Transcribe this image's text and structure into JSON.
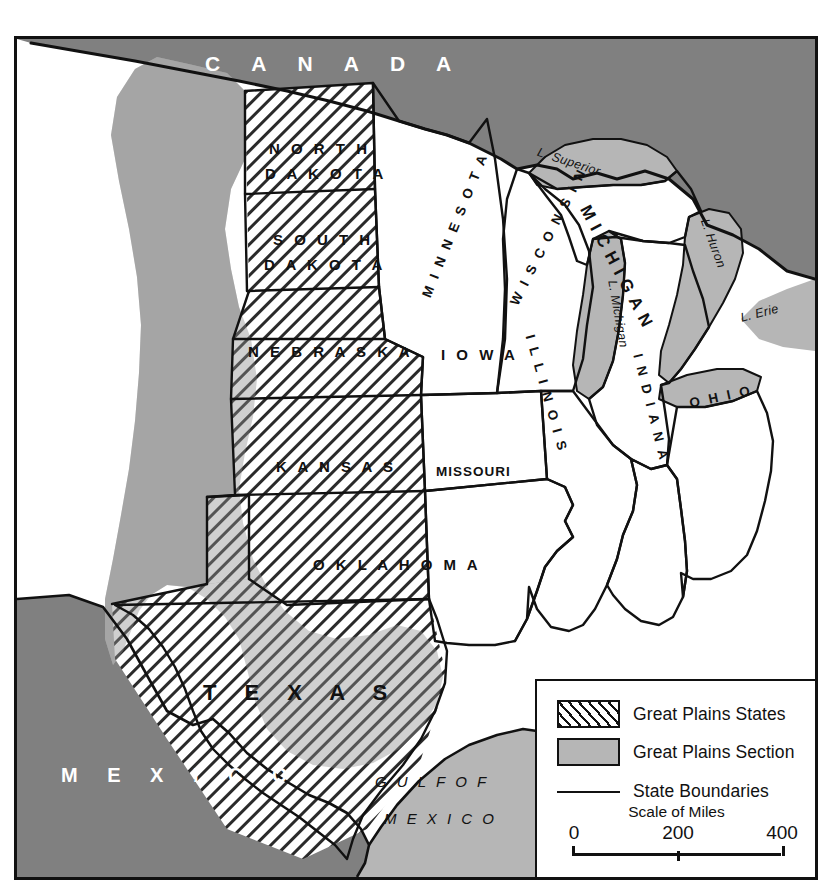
{
  "map": {
    "frame": {
      "border_color": "#111111"
    },
    "colors": {
      "foreign_land": "#808080",
      "great_plains_section": "#b6b6b6",
      "water": "#b6b6b6",
      "state_fill": "#ffffff",
      "ink": "#111111"
    },
    "countries": [
      {
        "name": "CANADA",
        "label": "C A N A D A"
      },
      {
        "name": "MEXICO",
        "label": "M E X I C O"
      }
    ],
    "water_bodies": [
      {
        "name": "gulf-of-mexico",
        "line1": "G U L F   O F",
        "line2": "M E X I C O"
      },
      {
        "name": "lake-superior",
        "label": "L. Superior"
      },
      {
        "name": "lake-michigan",
        "label": "L. Michigan"
      },
      {
        "name": "lake-huron",
        "label": "L. Huron"
      },
      {
        "name": "lake-erie",
        "label": "L. Erie"
      }
    ],
    "great_plains_states": [
      {
        "name": "north-dakota",
        "line1": "N O R T H",
        "line2": "D A K O T A"
      },
      {
        "name": "south-dakota",
        "line1": "S O U T H",
        "line2": "D A K O T A"
      },
      {
        "name": "nebraska",
        "line1": "N E B R A S K A"
      },
      {
        "name": "kansas",
        "line1": "K A N S A S"
      },
      {
        "name": "oklahoma",
        "line1": "O K L A H O M A"
      },
      {
        "name": "texas",
        "line1": "T E X A S"
      }
    ],
    "other_states": [
      {
        "name": "minnesota",
        "label": "M I N N E S O T A"
      },
      {
        "name": "wisconsin",
        "label": "W I S C O N S I N"
      },
      {
        "name": "michigan",
        "label": "MICHIGAN"
      },
      {
        "name": "iowa",
        "label": "I O W A"
      },
      {
        "name": "missouri",
        "label": "MISSOURI"
      },
      {
        "name": "illinois",
        "label": "I L L I N O I S"
      },
      {
        "name": "indiana",
        "label": "I N D I A N A"
      },
      {
        "name": "ohio",
        "label": "O H I O"
      }
    ]
  },
  "legend": {
    "items": [
      {
        "key": "great-plains-states",
        "label": "Great Plains States",
        "symbol": "hatch"
      },
      {
        "key": "great-plains-section",
        "label": "Great Plains Section",
        "symbol": "solid-gray"
      },
      {
        "key": "state-boundaries",
        "label": "State Boundaries",
        "symbol": "line"
      }
    ],
    "scale": {
      "title": "Scale of Miles",
      "ticks": [
        "0",
        "200",
        "400"
      ]
    }
  }
}
